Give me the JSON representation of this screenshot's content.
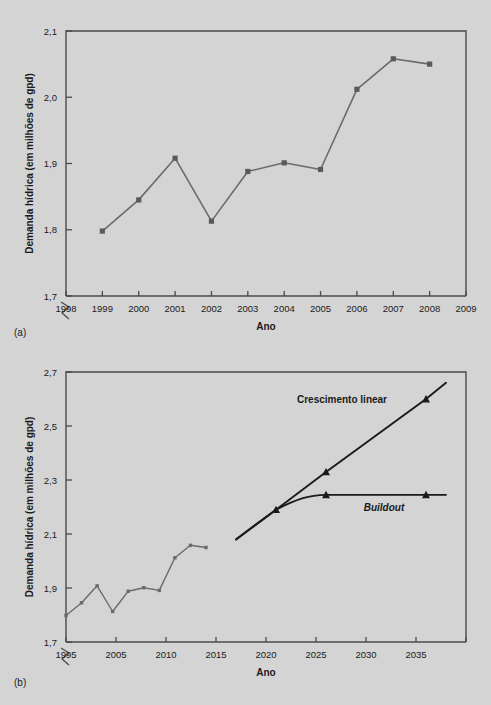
{
  "figure": {
    "background": "#d4d4d4",
    "line_color_historic": "#6b6b6b",
    "line_color_projection": "#1a1a1a",
    "axis_color": "#4a4a4a"
  },
  "panel_a": {
    "tag": "(a)",
    "xlabel": "Ano",
    "ylabel": "Demanda hídrica (em milhões de gpd)",
    "y_ticks": [
      "1,7",
      "1,8",
      "1,9",
      "2,0",
      "2,1"
    ],
    "x_ticks": [
      "1998",
      "1999",
      "2000",
      "2001",
      "2002",
      "2003",
      "2004",
      "2005",
      "2006",
      "2007",
      "2008",
      "2009"
    ],
    "axis_break": true
  },
  "panel_b": {
    "tag": "(b)",
    "xlabel": "Ano",
    "ylabel": "Demanda hídrica (em milhões de gpd)",
    "y_ticks": [
      "1,7",
      "1,9",
      "2,1",
      "2,3",
      "2,5",
      "2,7"
    ],
    "x_ticks": [
      "1995",
      "2005",
      "2010",
      "2015",
      "2020",
      "2025",
      "2030",
      "2035"
    ],
    "annotation_linear": "Crescimento linear",
    "annotation_buildout": "Buildout",
    "axis_break": true
  },
  "chart_data": [
    {
      "type": "line",
      "title": "(a)",
      "xlabel": "Ano",
      "ylabel": "Demanda hídrica (em milhões de gpd)",
      "xlim": [
        1998,
        2009
      ],
      "ylim": [
        1.7,
        2.1
      ],
      "xticks": [
        1998,
        1999,
        2000,
        2001,
        2002,
        2003,
        2004,
        2005,
        2006,
        2007,
        2008,
        2009
      ],
      "yticks": [
        1.7,
        1.8,
        1.9,
        2.0,
        2.1
      ],
      "ytick_labels": [
        "1,7",
        "1,8",
        "1,9",
        "2,0",
        "2,1"
      ],
      "grid": false,
      "legend": "none",
      "axis_break_y": true,
      "series": [
        {
          "name": "Demanda histórica",
          "marker": "square",
          "color": "#6b6b6b",
          "x": [
            1999,
            2000,
            2001,
            2002,
            2003,
            2004,
            2005,
            2006,
            2007,
            2008
          ],
          "values": [
            1.798,
            1.845,
            1.908,
            1.813,
            1.888,
            1.901,
            1.891,
            2.012,
            2.058,
            2.05
          ]
        }
      ]
    },
    {
      "type": "line",
      "title": "(b)",
      "xlabel": "Ano",
      "ylabel": "Demanda hídrica (em milhões de gpd)",
      "xlim": [
        1995,
        2035
      ],
      "ylim": [
        1.7,
        2.7
      ],
      "xticks": [
        1995,
        2000,
        2005,
        2010,
        2015,
        2020,
        2025,
        2030,
        2035
      ],
      "xtick_labels": [
        "1995",
        "2005",
        "2010",
        "2015",
        "2020",
        "2025",
        "2030",
        "2035"
      ],
      "yticks": [
        1.7,
        1.9,
        2.1,
        2.3,
        2.5,
        2.7
      ],
      "ytick_labels": [
        "1,7",
        "1,9",
        "2,1",
        "2,3",
        "2,5",
        "2,7"
      ],
      "grid": false,
      "legend": "inline-annotations",
      "axis_break_y": true,
      "series": [
        {
          "name": "Demanda histórica",
          "marker": "small-square",
          "color": "#6b6b6b",
          "x": [
            1995,
            1996,
            1997,
            1998,
            1999,
            2000,
            2001,
            2002,
            2003,
            2004,
            2005,
            2006,
            2007,
            2008,
            2009
          ],
          "values": [
            1.798,
            1.845,
            1.908,
            1.813,
            1.888,
            1.901,
            1.891,
            2.012,
            2.058,
            2.05,
            2.05,
            2.05,
            2.05,
            2.05,
            2.05
          ]
        },
        {
          "name": "Crescimento linear",
          "marker": "triangle",
          "color": "#1a1a1a",
          "x": [
            2012,
            2016,
            2021,
            2031,
            2033
          ],
          "values": [
            2.08,
            2.19,
            2.33,
            2.6,
            2.66
          ]
        },
        {
          "name": "Buildout",
          "marker": "triangle",
          "color": "#1a1a1a",
          "x": [
            2012,
            2016,
            2021,
            2031,
            2033
          ],
          "values": [
            2.08,
            2.19,
            2.245,
            2.245,
            2.245
          ]
        }
      ],
      "annotations": [
        {
          "text": "Crescimento linear",
          "x": 2023,
          "y": 2.6,
          "style": "bold"
        },
        {
          "text": "Buildout",
          "x": 2027,
          "y": 2.19,
          "style": "bold-italic"
        }
      ]
    }
  ]
}
